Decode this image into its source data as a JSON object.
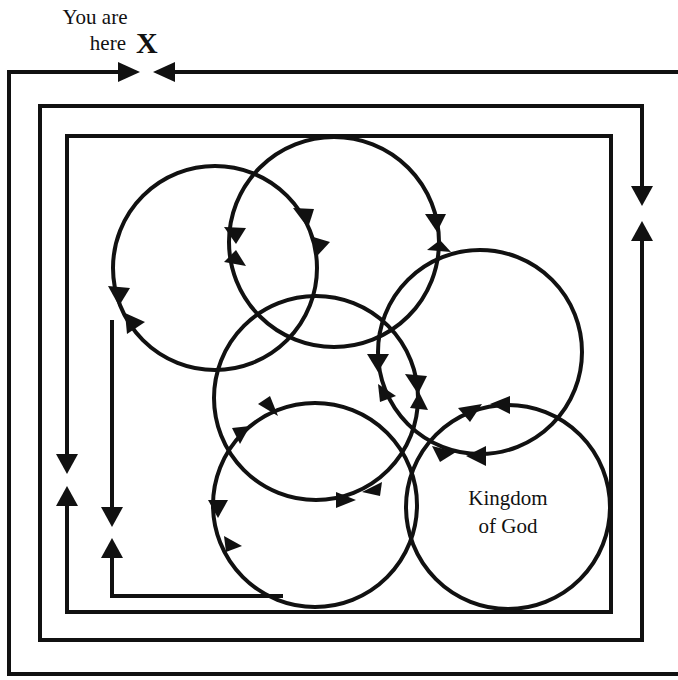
{
  "labels": {
    "start_line1": "You are",
    "start_line2": "here",
    "start_marker": "X",
    "goal_line1": "Kingdom",
    "goal_line2": "of God"
  },
  "colors": {
    "stroke": "#111111",
    "background": "#ffffff"
  },
  "structure": {
    "frames": [
      {
        "name": "outer-frame",
        "note": "open path starting at You-are-here, wrapping left/down/right"
      },
      {
        "name": "middle-frame",
        "note": "nested path with arrows pointing toward each other on right and left sides"
      },
      {
        "name": "inner-frame",
        "note": "innermost rectangle enclosing circles"
      }
    ],
    "circles": [
      {
        "name": "circle-top-left",
        "cx": 215,
        "cy": 268,
        "r": 102
      },
      {
        "name": "circle-top-center",
        "cx": 334,
        "cy": 242,
        "r": 105
      },
      {
        "name": "circle-center",
        "cx": 316,
        "cy": 398,
        "r": 102
      },
      {
        "name": "circle-right",
        "cx": 480,
        "cy": 352,
        "r": 102
      },
      {
        "name": "circle-bottom-center",
        "cx": 315,
        "cy": 505,
        "r": 102
      },
      {
        "name": "circle-kingdom",
        "cx": 508,
        "cy": 507,
        "r": 102
      }
    ]
  }
}
